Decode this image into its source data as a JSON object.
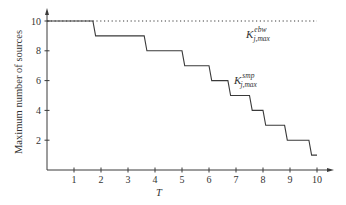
{
  "chart_data": {
    "type": "line",
    "title": "",
    "xlabel": "T",
    "ylabel": "Maximum number of sources",
    "xlim": [
      0,
      10.5
    ],
    "ylim": [
      0,
      10.8
    ],
    "xticks": [
      1,
      2,
      3,
      4,
      5,
      6,
      7,
      8,
      9,
      10
    ],
    "yticks": [
      2,
      4,
      6,
      8,
      10
    ],
    "grid": false,
    "legend": "none (inline annotations)",
    "series": [
      {
        "name": "K_j,max^ebw",
        "style": "dotted",
        "x": [
          0,
          10
        ],
        "y": [
          10,
          10
        ]
      },
      {
        "name": "K_j,max^smp",
        "style": "solid-step",
        "x": [
          0,
          1.7,
          1.8,
          3.6,
          3.7,
          5.0,
          5.1,
          6.0,
          6.1,
          6.7,
          6.8,
          7.5,
          7.6,
          8.0,
          8.1,
          8.8,
          8.9,
          9.7,
          9.8,
          10.0
        ],
        "y": [
          10,
          10,
          9,
          9,
          8,
          8,
          7,
          7,
          6,
          6,
          5,
          5,
          4,
          4,
          3,
          3,
          2,
          2,
          1,
          1
        ]
      }
    ],
    "annotations": [
      {
        "text": "K",
        "sup": "ebw",
        "sub": "j,max",
        "x": 8.3,
        "y": 9.2
      },
      {
        "text": "K",
        "sup": "smp",
        "sub": "j,max",
        "x": 7.2,
        "y": 7.0
      }
    ]
  },
  "labels": {
    "xlabel": "T",
    "ylabel": "Maximum number of sources",
    "x_ticks": [
      "1",
      "2",
      "3",
      "4",
      "5",
      "6",
      "7",
      "8",
      "9",
      "10"
    ],
    "y_ticks": [
      "2",
      "4",
      "6",
      "8",
      "10"
    ],
    "annot_ebw": {
      "base": "K",
      "sup": "ebw",
      "sub": "j,max"
    },
    "annot_smp": {
      "base": "K",
      "sup": "smp",
      "sub": "j,max"
    }
  },
  "colors": {
    "line": "#3a3a3a",
    "axis": "#3a3a3a",
    "text": "#333333"
  }
}
